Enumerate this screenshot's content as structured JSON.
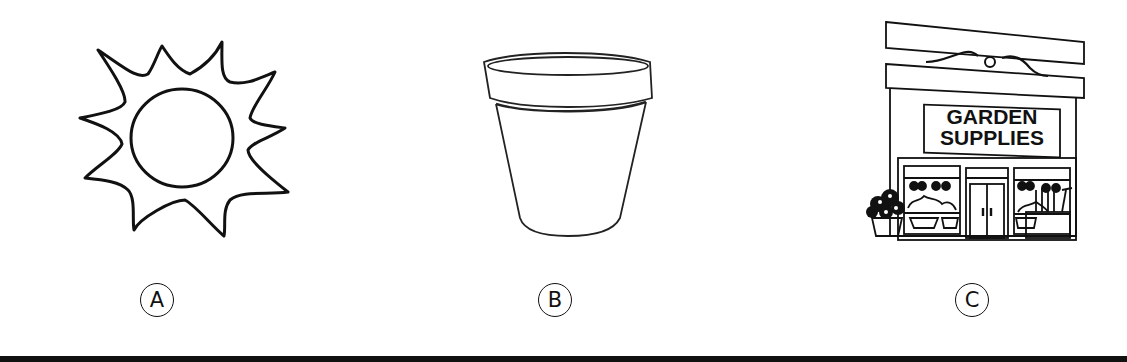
{
  "options": [
    {
      "label": "A",
      "image": "sun-icon"
    },
    {
      "label": "B",
      "image": "flower-pot-icon"
    },
    {
      "label": "C",
      "image": "garden-store-icon"
    }
  ],
  "store_sign": {
    "line1": "GARDEN",
    "line2": "SUPPLIES"
  },
  "colors": {
    "stroke": "#111111",
    "background": "#ffffff"
  }
}
